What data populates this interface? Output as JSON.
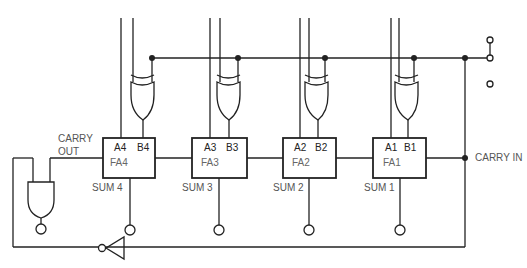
{
  "diagram": {
    "type": "4-bit ripple-carry adder with XOR complement control and end-around carry",
    "labels": {
      "carry_out_line1": "CARRY",
      "carry_out_line2": "OUT",
      "carry_in": "CARRY IN"
    },
    "adders": [
      {
        "name": "FA4",
        "a": "A4",
        "b": "B4",
        "sum": "SUM 4"
      },
      {
        "name": "FA3",
        "a": "A3",
        "b": "B3",
        "sum": "SUM 3"
      },
      {
        "name": "FA2",
        "a": "A2",
        "b": "B2",
        "sum": "SUM 2"
      },
      {
        "name": "FA1",
        "a": "A1",
        "b": "B1",
        "sum": "SUM 1"
      }
    ],
    "components": [
      "XOR gate x4",
      "AND gate with inverted output",
      "inverter",
      "SPDT switch"
    ],
    "colors": {
      "line": "#222222",
      "text": "#555555",
      "background": "#ffffff"
    }
  }
}
